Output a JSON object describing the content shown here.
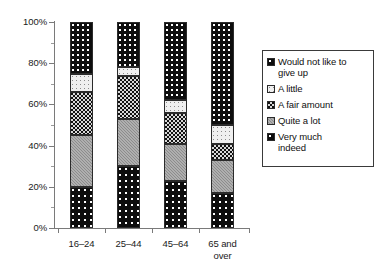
{
  "chart_data": {
    "type": "bar",
    "subtype": "stacked-percentage",
    "title": "",
    "xlabel": "",
    "ylabel": "",
    "ylim": [
      0,
      100
    ],
    "y_unit": "%",
    "grid": false,
    "legend_position": "right",
    "categories": [
      "16–24",
      "25–44",
      "45–64",
      "65 and\nover"
    ],
    "y_ticks": [
      "0%",
      "20%",
      "40%",
      "60%",
      "80%",
      "100%"
    ],
    "y_tick_values": [
      0,
      20,
      40,
      60,
      80,
      100
    ],
    "y_minor_tick_values": [
      10,
      30,
      50,
      70,
      90
    ],
    "series": [
      {
        "name": "Very much indeed",
        "values": [
          20,
          30,
          23,
          17
        ]
      },
      {
        "name": "Quite a lot",
        "values": [
          25,
          23,
          18,
          16
        ]
      },
      {
        "name": "A fair amount",
        "values": [
          21,
          21,
          15,
          8
        ]
      },
      {
        "name": "A little",
        "values": [
          9,
          4,
          6,
          9
        ]
      },
      {
        "name": "Would not like to give up",
        "values": [
          25,
          22,
          38,
          50
        ]
      }
    ],
    "cumulative_tops": {
      "16–24": [
        20,
        45,
        66,
        75,
        100
      ],
      "25–44": [
        30,
        53,
        74,
        78,
        100
      ],
      "45–64": [
        23,
        41,
        56,
        62,
        100
      ],
      "65 and over": [
        17,
        33,
        41,
        50,
        100
      ]
    }
  },
  "legend": {
    "items": [
      {
        "label": "Would not like to\ngive up",
        "pattern": "fill-not-give-up",
        "color": "#0d0d0d"
      },
      {
        "label": "A little",
        "pattern": "fill-a-little",
        "color": "#efefef"
      },
      {
        "label": "A fair amount",
        "pattern": "fill-fair-amount",
        "color": "#111111"
      },
      {
        "label": "Quite a lot",
        "pattern": "fill-quite-a-lot",
        "color": "#8c8c8c"
      },
      {
        "label": "Very much\nindeed",
        "pattern": "fill-very-much",
        "color": "#0d0d0d"
      }
    ]
  },
  "axis": {
    "line_color": "#7a7a7a",
    "text_color": "#1a1a1a"
  }
}
